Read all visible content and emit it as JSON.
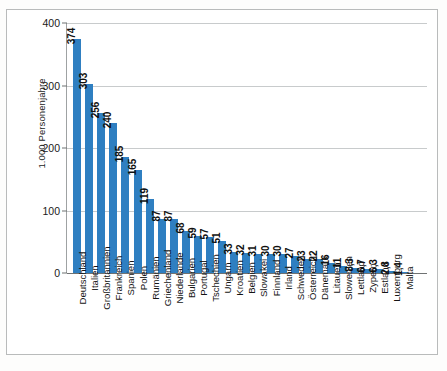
{
  "chart_data": {
    "type": "bar",
    "title": "",
    "subtitle": "",
    "xlabel": "",
    "ylabel": "1.000 Personenjahre",
    "ylim": [
      0,
      400
    ],
    "yticks": [
      0,
      100,
      200,
      300,
      400
    ],
    "ytick_labels": [
      "0",
      "100",
      "200",
      "300",
      "400"
    ],
    "grid": "horizontal",
    "legend": "none",
    "bar_color": "#2f7fc1",
    "value_label_decimal_separator": ",",
    "categories": [
      "Deutschland",
      "Italien",
      "Großbritannien",
      "Frankreich",
      "Spanien",
      "Polen",
      "Rumänien",
      "Griechenland",
      "Niederlande",
      "Bulgarien",
      "Portugal",
      "Tschechien",
      "Ungarn",
      "Kroatien",
      "Belgien",
      "Slowakei",
      "Finnland",
      "Irland",
      "Schweden",
      "Österreich",
      "Dänemark",
      "Litauen",
      "Slowenien",
      "Lettland",
      "Zypern",
      "Estland",
      "Luxemburg",
      "Malta"
    ],
    "values": [
      374,
      303,
      256,
      240,
      185,
      165,
      119,
      87,
      87,
      68,
      59,
      57,
      51,
      33,
      32,
      31,
      30,
      30,
      27,
      23,
      22,
      16,
      11,
      8.3,
      6.7,
      6.3,
      2.8,
      1.4
    ],
    "value_labels": [
      "374",
      "303",
      "256",
      "240",
      "185",
      "165",
      "119",
      "87",
      "87",
      "68",
      "59",
      "57",
      "51",
      "33",
      "32",
      "31",
      "30",
      "30",
      "27",
      "23",
      "22",
      "16",
      "11",
      "8,3",
      "6,7",
      "6,3",
      "2,8",
      "1,4"
    ]
  },
  "colors": {
    "bar": "#2f7fc1",
    "grid": "#c8cbcc",
    "axis": "#6f7273",
    "frame": "#b9bbbb",
    "text": "#1a1a1a",
    "background": "#ffffff"
  }
}
